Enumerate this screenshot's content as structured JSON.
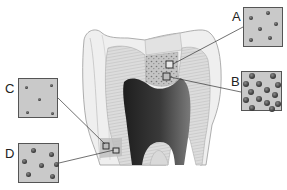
{
  "diagram": {
    "colors": {
      "background": "#ffffff",
      "inset_fill": "#c9c9c9",
      "inset_border": "#555555",
      "pulp": "#2a2a2a",
      "dentin": "#d6d6d6",
      "enamel": "#ececec",
      "leader_line": "#333333"
    },
    "insets": [
      {
        "id": "A",
        "label": "A",
        "dot_size": "small",
        "dot_count": 6,
        "description": "sparse small tubules, outer coronal dentin",
        "box": {
          "x": 243,
          "y": 7,
          "w": 40,
          "h": 40
        },
        "label_pos": {
          "x": 232,
          "y": 10
        },
        "target": {
          "x": 169,
          "y": 65
        }
      },
      {
        "id": "B",
        "label": "B",
        "dot_size": "large",
        "dot_count": 14,
        "description": "dense large tubules, inner coronal dentin near pulp",
        "box": {
          "x": 241,
          "y": 71,
          "w": 41,
          "h": 40
        },
        "label_pos": {
          "x": 231,
          "y": 75
        },
        "target": {
          "x": 167,
          "y": 76
        }
      },
      {
        "id": "C",
        "label": "C",
        "dot_size": "small",
        "dot_count": 5,
        "description": "sparse small tubules, outer root dentin",
        "box": {
          "x": 18,
          "y": 78,
          "w": 40,
          "h": 40
        },
        "label_pos": {
          "x": 5,
          "y": 82
        },
        "target": {
          "x": 106,
          "y": 146
        }
      },
      {
        "id": "D",
        "label": "D",
        "dot_size": "medium",
        "dot_count": 7,
        "description": "moderate medium tubules, inner root dentin",
        "box": {
          "x": 18,
          "y": 143,
          "w": 41,
          "h": 40
        },
        "label_pos": {
          "x": 5,
          "y": 147
        },
        "target": {
          "x": 116,
          "y": 151
        }
      }
    ]
  }
}
